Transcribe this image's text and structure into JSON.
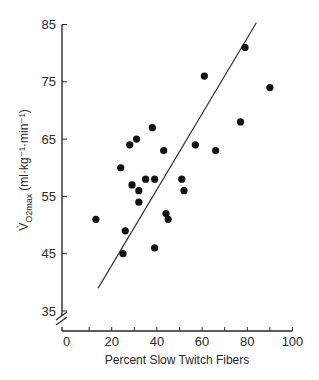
{
  "chart_data": {
    "type": "scatter",
    "title": "",
    "xlabel": "Percent Slow Twitch Fibers",
    "ylabel": {
      "main": "V̇",
      "sub": "O2max",
      "units": "(ml·kg⁻¹·min⁻¹)",
      "full": "V̇O2max (ml·kg⁻¹·min⁻¹)"
    },
    "xlim": [
      0,
      100
    ],
    "ylim": [
      35,
      85
    ],
    "y_axis_break": true,
    "x_ticks": [
      0,
      20,
      40,
      60,
      80,
      100
    ],
    "x_minor_ticks": [
      10,
      30,
      50,
      70,
      90
    ],
    "y_ticks": [
      35,
      45,
      55,
      65,
      75,
      85
    ],
    "grid": false,
    "legend": null,
    "colors": {
      "points": "#111111",
      "line": "#333333",
      "axis": "#2a2a2a"
    },
    "points": [
      {
        "x": 13,
        "y": 51
      },
      {
        "x": 25,
        "y": 45
      },
      {
        "x": 26,
        "y": 49
      },
      {
        "x": 24,
        "y": 60
      },
      {
        "x": 28,
        "y": 64
      },
      {
        "x": 31,
        "y": 65
      },
      {
        "x": 29,
        "y": 57
      },
      {
        "x": 32,
        "y": 56
      },
      {
        "x": 32,
        "y": 54
      },
      {
        "x": 35,
        "y": 58
      },
      {
        "x": 38,
        "y": 67
      },
      {
        "x": 39,
        "y": 58
      },
      {
        "x": 43,
        "y": 63
      },
      {
        "x": 39,
        "y": 46
      },
      {
        "x": 44,
        "y": 52
      },
      {
        "x": 45,
        "y": 51
      },
      {
        "x": 51,
        "y": 58
      },
      {
        "x": 52,
        "y": 56
      },
      {
        "x": 57,
        "y": 64
      },
      {
        "x": 61,
        "y": 76
      },
      {
        "x": 66,
        "y": 63
      },
      {
        "x": 77,
        "y": 68
      },
      {
        "x": 79,
        "y": 81
      },
      {
        "x": 90,
        "y": 74
      }
    ],
    "regression_line": {
      "start": {
        "x": 14,
        "y": 39
      },
      "end": {
        "x": 84,
        "y": 85.3
      }
    }
  }
}
